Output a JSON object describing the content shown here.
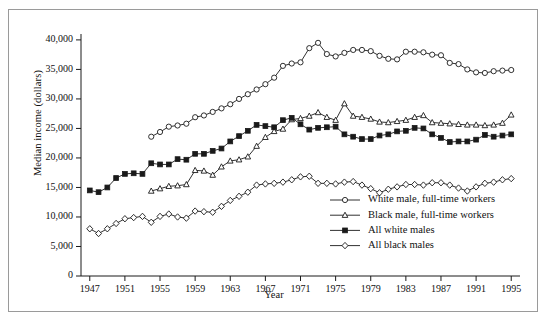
{
  "figure": {
    "ylabel": "Median income (dollars)",
    "xlabel": "Year",
    "frame_color": "#9a9a9a",
    "line_color": "#1a1a1a"
  },
  "axis": {
    "y_ticks": [
      "0",
      "5,000",
      "10,000",
      "15,000",
      "20,000",
      "25,000",
      "30,000",
      "35,000",
      "40,000"
    ],
    "y_tick_values": [
      0,
      5000,
      10000,
      15000,
      20000,
      25000,
      30000,
      35000,
      40000
    ],
    "x_ticks": [
      "1947",
      "1951",
      "1955",
      "1959",
      "1963",
      "1967",
      "1971",
      "1975",
      "1979",
      "1983",
      "1987",
      "1991",
      "1995"
    ],
    "x_tick_values": [
      1947,
      1951,
      1955,
      1959,
      1963,
      1967,
      1971,
      1975,
      1979,
      1983,
      1987,
      1991,
      1995
    ]
  },
  "legend": {
    "position": "inside-bottom-right",
    "items": [
      {
        "label": "White male, full-time workers",
        "marker": "circle-open",
        "key": "white_fulltime"
      },
      {
        "label": "Black male, full-time workers",
        "marker": "triangle-open",
        "key": "black_fulltime"
      },
      {
        "label": "All white males",
        "marker": "square-filled",
        "key": "all_white"
      },
      {
        "label": "All black males",
        "marker": "diamond-open",
        "key": "all_black"
      }
    ]
  },
  "chart_data": {
    "type": "line",
    "title": "",
    "xlabel": "Year",
    "ylabel": "Median income (dollars)",
    "xlim": [
      1946,
      1996
    ],
    "ylim": [
      0,
      41000
    ],
    "grid": false,
    "legend_position": "inside-bottom-right",
    "series": [
      {
        "name": "White male, full-time workers",
        "marker": "circle-open",
        "x": [
          1954,
          1955,
          1956,
          1957,
          1958,
          1959,
          1960,
          1961,
          1962,
          1963,
          1964,
          1965,
          1966,
          1967,
          1968,
          1969,
          1970,
          1971,
          1972,
          1973,
          1974,
          1975,
          1976,
          1977,
          1978,
          1979,
          1980,
          1981,
          1982,
          1983,
          1984,
          1985,
          1986,
          1987,
          1988,
          1989,
          1990,
          1991,
          1992,
          1993,
          1994,
          1995
        ],
        "values": [
          23600,
          24400,
          25300,
          25500,
          25800,
          26900,
          27200,
          27800,
          28400,
          29100,
          30000,
          30800,
          31600,
          32500,
          33600,
          35600,
          36000,
          36200,
          38600,
          39500,
          37600,
          37200,
          37800,
          38300,
          38300,
          38100,
          37300,
          36800,
          36700,
          38000,
          38000,
          37900,
          37500,
          37400,
          36100,
          35900,
          35000,
          34500,
          34400,
          34700,
          34800,
          34900
        ]
      },
      {
        "name": "Black male, full-time workers",
        "marker": "triangle-open",
        "x": [
          1954,
          1955,
          1956,
          1957,
          1958,
          1959,
          1960,
          1961,
          1962,
          1963,
          1964,
          1965,
          1966,
          1967,
          1968,
          1969,
          1970,
          1971,
          1972,
          1973,
          1974,
          1975,
          1976,
          1977,
          1978,
          1979,
          1980,
          1981,
          1982,
          1983,
          1984,
          1985,
          1986,
          1987,
          1988,
          1989,
          1990,
          1991,
          1992,
          1993,
          1994,
          1995
        ],
        "values": [
          14400,
          14800,
          15200,
          15300,
          15500,
          17900,
          17800,
          17100,
          18500,
          19500,
          19700,
          20200,
          22000,
          23500,
          24500,
          24900,
          26500,
          26700,
          27100,
          27700,
          26900,
          26400,
          29200,
          27100,
          26900,
          26600,
          26100,
          26000,
          26200,
          26400,
          26900,
          27200,
          26000,
          25900,
          25800,
          25700,
          25600,
          25600,
          25500,
          25600,
          25900,
          27300
        ]
      },
      {
        "name": "All white males",
        "marker": "square-filled",
        "x": [
          1947,
          1948,
          1949,
          1950,
          1951,
          1952,
          1953,
          1954,
          1955,
          1956,
          1957,
          1958,
          1959,
          1960,
          1961,
          1962,
          1963,
          1964,
          1965,
          1966,
          1967,
          1968,
          1969,
          1970,
          1971,
          1972,
          1973,
          1974,
          1975,
          1976,
          1977,
          1978,
          1979,
          1980,
          1981,
          1982,
          1983,
          1984,
          1985,
          1986,
          1987,
          1988,
          1989,
          1990,
          1991,
          1992,
          1993,
          1994,
          1995
        ],
        "values": [
          14500,
          14200,
          15000,
          16600,
          17300,
          17400,
          17300,
          19100,
          18900,
          18900,
          19800,
          19700,
          20700,
          20700,
          21200,
          21600,
          22800,
          23700,
          24600,
          25600,
          25400,
          25200,
          26400,
          26800,
          25700,
          24800,
          25100,
          25200,
          25300,
          24000,
          23600,
          23200,
          23200,
          23800,
          24000,
          24500,
          24600,
          25100,
          25000,
          24000,
          23400,
          22700,
          22800,
          22800,
          23100,
          23900,
          23600,
          23800,
          24000
        ]
      },
      {
        "name": "All black males",
        "marker": "diamond-open",
        "x": [
          1947,
          1948,
          1949,
          1950,
          1951,
          1952,
          1953,
          1954,
          1955,
          1956,
          1957,
          1958,
          1959,
          1960,
          1961,
          1962,
          1963,
          1964,
          1965,
          1966,
          1967,
          1968,
          1969,
          1970,
          1971,
          1972,
          1973,
          1974,
          1975,
          1976,
          1977,
          1978,
          1979,
          1980,
          1981,
          1982,
          1983,
          1984,
          1985,
          1986,
          1987,
          1988,
          1989,
          1990,
          1991,
          1992,
          1993,
          1994,
          1995
        ],
        "values": [
          8000,
          7200,
          8000,
          8900,
          9700,
          9900,
          10100,
          9100,
          10100,
          10500,
          10000,
          9800,
          11000,
          10900,
          10800,
          11800,
          12800,
          13500,
          14200,
          15400,
          15600,
          15700,
          15900,
          16300,
          16800,
          16900,
          15700,
          15700,
          15600,
          15900,
          16000,
          15400,
          14800,
          14100,
          14700,
          15100,
          15500,
          15500,
          15400,
          15800,
          15800,
          15400,
          14900,
          14400,
          15100,
          15700,
          15900,
          16300,
          16500
        ]
      }
    ]
  }
}
